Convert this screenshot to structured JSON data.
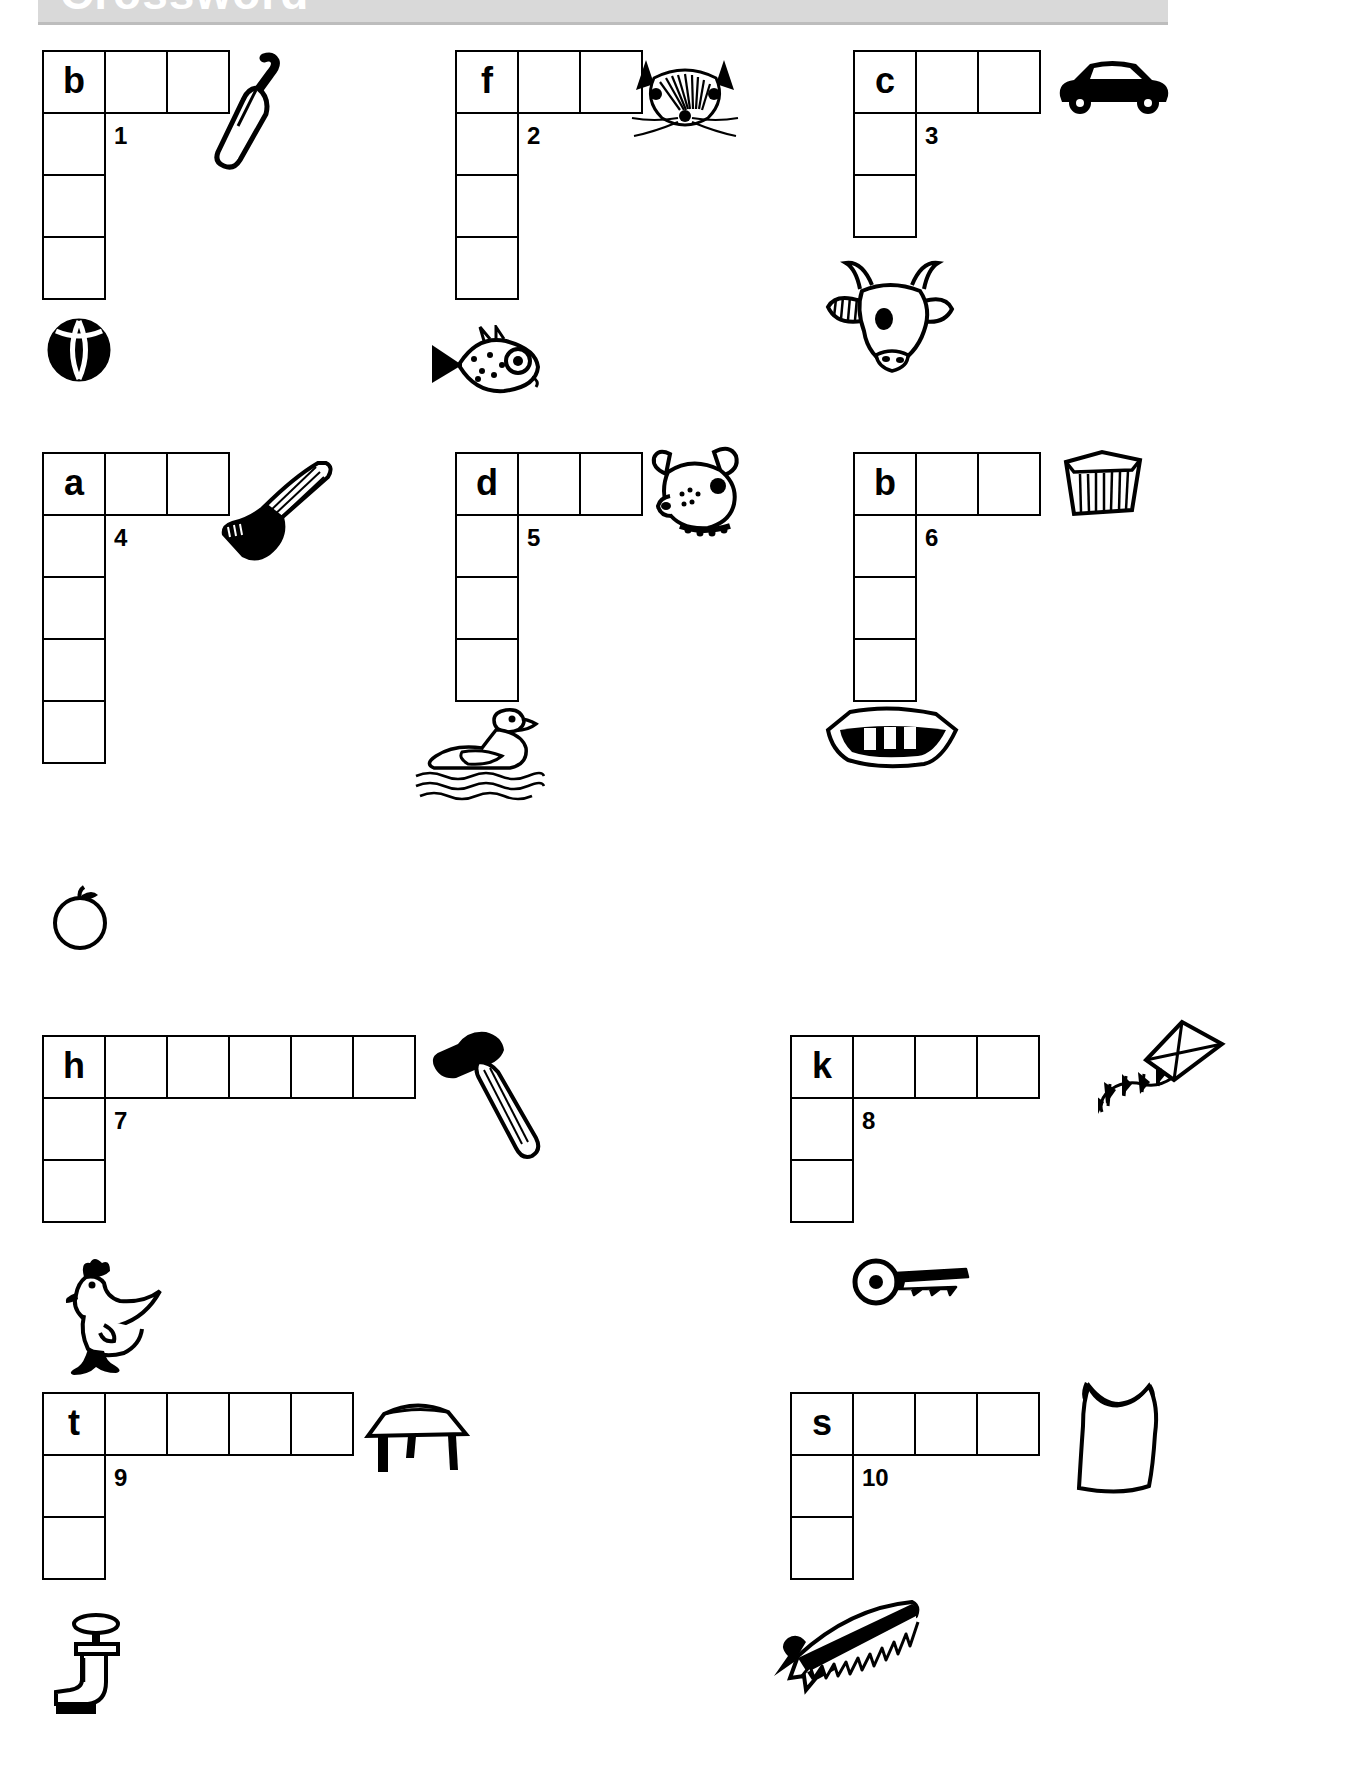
{
  "header": {
    "title": "Crossword",
    "band_color": "#d9d9d9"
  },
  "worksheet": {
    "ink_color": "#000000",
    "cell_size": 64
  },
  "puzzles": [
    {
      "number": "1",
      "letter": "b",
      "across_cells": 3,
      "down_cells": 4,
      "across_picture": "bat-icon",
      "down_picture": "ball-icon"
    },
    {
      "number": "2",
      "letter": "f",
      "across_cells": 3,
      "down_cells": 4,
      "across_picture": "fox-icon",
      "down_picture": "fish-icon"
    },
    {
      "number": "3",
      "letter": "c",
      "across_cells": 3,
      "down_cells": 3,
      "across_picture": "car-icon",
      "down_picture": "cow-icon"
    },
    {
      "number": "4",
      "letter": "a",
      "across_cells": 3,
      "down_cells": 5,
      "across_picture": "axe-icon",
      "down_picture": "apple-icon"
    },
    {
      "number": "5",
      "letter": "d",
      "across_cells": 3,
      "down_cells": 4,
      "across_picture": "dog-icon",
      "down_picture": "duck-icon"
    },
    {
      "number": "6",
      "letter": "b",
      "across_cells": 3,
      "down_cells": 4,
      "across_picture": "box-icon",
      "down_picture": "boat-icon"
    },
    {
      "number": "7",
      "letter": "h",
      "across_cells": 6,
      "down_cells": 3,
      "across_picture": "hammer-icon",
      "down_picture": "hen-icon"
    },
    {
      "number": "8",
      "letter": "k",
      "across_cells": 4,
      "down_cells": 3,
      "across_picture": "kite-icon",
      "down_picture": "key-icon"
    },
    {
      "number": "9",
      "letter": "t",
      "across_cells": 5,
      "down_cells": 3,
      "across_picture": "table-icon",
      "down_picture": "tap-icon"
    },
    {
      "number": "10",
      "letter": "s",
      "across_cells": 4,
      "down_cells": 3,
      "across_picture": "sack-icon",
      "down_picture": "saw-icon"
    }
  ]
}
